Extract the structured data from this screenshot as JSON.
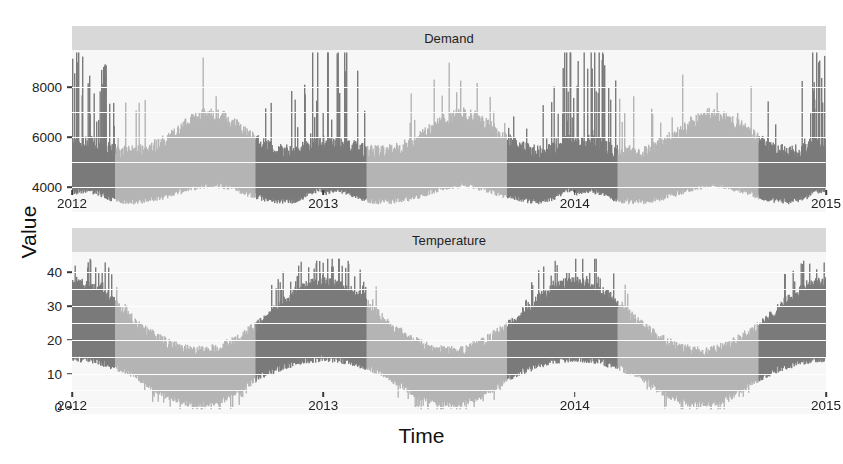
{
  "chart_data": {
    "type": "line",
    "title": "",
    "xlabel": "Time",
    "ylabel": "Value",
    "grid": true,
    "legend": false,
    "facet_layout": "2 rows x 1 column, strip labels on top",
    "facets": [
      {
        "label": "Demand",
        "ylim": [
          3000,
          9500
        ],
        "yticks": [
          4000,
          6000,
          8000
        ],
        "ytick_labels": [
          "4000",
          "6000",
          "8000"
        ],
        "units": "MW",
        "description": "Half-hourly electricity demand, strong summer spikes each January-February, broad winter shoulder.",
        "seasonal_profile": {
          "baseline": 3500,
          "summer_peak": 9300,
          "winter_peak": 6700
        }
      },
      {
        "label": "Temperature",
        "ylim": [
          -2,
          46
        ],
        "yticks": [
          0,
          10,
          20,
          30,
          40
        ],
        "ytick_labels": [
          "0",
          "10",
          "20",
          "30",
          "40"
        ],
        "units": "degrees Celsius",
        "description": "Half-hourly temperature, summer maxima above 40, winter minima near 0.",
        "seasonal_profile": {
          "summer_high": 43,
          "summer_low": 14,
          "winter_high": 20,
          "winter_low": 1
        }
      }
    ],
    "x": {
      "range": [
        "2012",
        "2015"
      ],
      "ticks": [
        2012,
        2013,
        2014,
        2015
      ],
      "tick_labels": [
        "2012",
        "2013",
        "2014",
        "2015"
      ]
    },
    "color_banding": {
      "description": "Alternating dark/light shading by season block",
      "dark": "#7a7a7a",
      "light": "#b4b4b4",
      "segments": [
        {
          "start": 2012.0,
          "end": 2012.17,
          "shade": "dark"
        },
        {
          "start": 2012.17,
          "end": 2012.73,
          "shade": "light"
        },
        {
          "start": 2012.73,
          "end": 2013.17,
          "shade": "dark"
        },
        {
          "start": 2013.17,
          "end": 2013.73,
          "shade": "light"
        },
        {
          "start": 2013.73,
          "end": 2014.17,
          "shade": "dark"
        },
        {
          "start": 2014.17,
          "end": 2014.73,
          "shade": "light"
        },
        {
          "start": 2014.73,
          "end": 2015.0,
          "shade": "dark"
        }
      ]
    },
    "style": {
      "panel_background": "#f7f7f7",
      "strip_background": "#d8d8d8",
      "gridline_color": "#ffffff",
      "text_color": "#1e1e1e"
    }
  },
  "axis": {
    "y_title": "Value",
    "x_title": "Time"
  }
}
